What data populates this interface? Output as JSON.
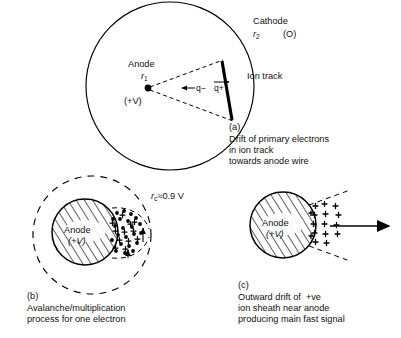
{
  "figure": {
    "ink_color": "#000000",
    "background": "#ffffff"
  },
  "panel_a": {
    "id": "(a)",
    "cathode_label": "Cathode",
    "cathode_radius_symbol": "r",
    "cathode_radius_subscript": "2",
    "cathode_potential": "(O)",
    "anode_label": "Anode",
    "anode_radius_symbol": "r",
    "anode_radius_subscript": "1",
    "anode_potential": "(+V)",
    "ion_track_label": "Ion track",
    "negative_charge_label": "q−",
    "positive_charge_label": "q+",
    "caption_lines": [
      "Drift of primary electrons",
      "in ion track",
      "towards anode wire"
    ],
    "outer_circle": {
      "cx": 170,
      "cy": 86,
      "r": 84
    },
    "anode_point": {
      "cx": 148,
      "cy": 88,
      "r": 3.4
    },
    "ion_track_segment": {
      "x1": 222,
      "y1": 61,
      "x2": 232,
      "y2": 120
    }
  },
  "panel_b": {
    "id": "(b)",
    "anode_label": "Anode",
    "anode_potential": "(+V)",
    "critical_radius_symbol": "r",
    "critical_radius_subscript": "c",
    "critical_radius_value": "≈0.9 V",
    "caption_lines": [
      "Avalanche/multiplication",
      "process for one electron"
    ],
    "dashed_circle": {
      "cx": 92,
      "cy": 235,
      "r": 59
    },
    "anode_circle": {
      "cx": 85,
      "cy": 232,
      "r": 33
    },
    "electron_symbol": "•",
    "ion_symbol": "+"
  },
  "panel_c": {
    "id": "(c)",
    "anode_label": "Anode",
    "anode_potential": "(+V)",
    "caption_lines": [
      "Outward drift of  +ve",
      "ion sheath near anode",
      "producing main fast signal"
    ],
    "anode_circle": {
      "cx": 283,
      "cy": 225,
      "r": 33
    },
    "ion_symbol": "+",
    "drift_arrow": {
      "x1": 330,
      "y1": 226,
      "x2": 389,
      "y2": 226
    }
  }
}
